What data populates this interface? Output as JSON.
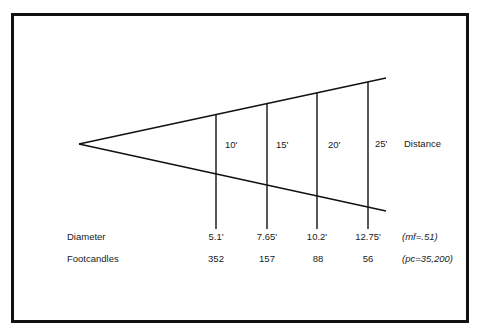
{
  "diagram": {
    "type": "light beam spread",
    "distance_label": "Distance",
    "distances": [
      "10'",
      "15'",
      "20'",
      "25'"
    ],
    "rows": [
      {
        "label": "Diameter",
        "values": [
          "5.1'",
          "7.65'",
          "10.2'",
          "12.75'"
        ],
        "note": "(mf=.51)"
      },
      {
        "label": "Footcandles",
        "values": [
          "352",
          "157",
          "88",
          "56"
        ],
        "note": "(pc=35,200)"
      }
    ],
    "colors": {
      "line": "#111111",
      "text": "#1a1a1a",
      "background": "#ffffff"
    }
  }
}
